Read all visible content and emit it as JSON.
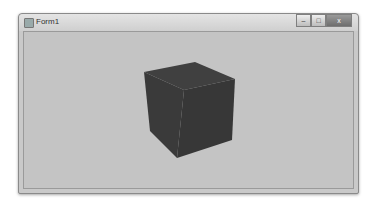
{
  "window": {
    "title": "Form1",
    "controls": {
      "minimize": "–",
      "maximize": "□",
      "close": "x"
    }
  },
  "scene": {
    "background": "#c4c4c4",
    "object": "cube",
    "cube_color": "#3c3c3c"
  }
}
